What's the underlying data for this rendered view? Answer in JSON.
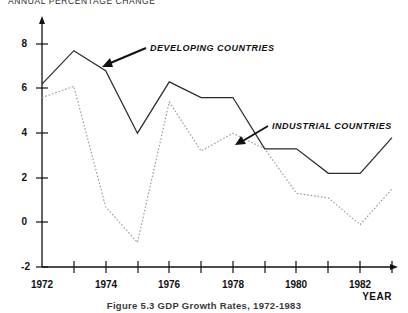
{
  "figure": {
    "top_title": "ANNUAL PERCENTAGE CHANGE",
    "caption": "Figure 5.3  GDP Growth Rates, 1972-1983",
    "xaxis_name": "YEAR"
  },
  "annotations": {
    "developing": "DEVELOPING COUNTRIES",
    "industrial": "INDUSTRIAL COUNTRIES"
  },
  "ticks": {
    "y": [
      "8",
      "6",
      "4",
      "2",
      "0",
      "-2"
    ],
    "x": [
      "1972",
      "1974",
      "1976",
      "1978",
      "1980",
      "1982"
    ]
  },
  "chart_data": {
    "type": "line",
    "title": "ANNUAL PERCENTAGE CHANGE",
    "subtitle": "Figure 5.3  GDP Growth Rates, 1972-1983",
    "xlabel": "YEAR",
    "ylabel": "ANNUAL PERCENTAGE CHANGE",
    "x": [
      1972,
      1973,
      1974,
      1975,
      1976,
      1977,
      1978,
      1979,
      1980,
      1981,
      1982,
      1983
    ],
    "xlim": [
      1972,
      1983
    ],
    "ylim": [
      -2,
      8
    ],
    "yticks": [
      -2,
      0,
      2,
      4,
      6,
      8
    ],
    "xticks": [
      1972,
      1974,
      1976,
      1978,
      1980,
      1982
    ],
    "xminor_ticks": [
      1973,
      1975,
      1977,
      1979,
      1981,
      1983
    ],
    "grid": false,
    "legend": "inline-annotations",
    "series": [
      {
        "name": "DEVELOPING COUNTRIES",
        "style": "solid",
        "color": "#2b2b2b",
        "values": [
          6.2,
          7.7,
          6.8,
          4.0,
          6.3,
          5.6,
          5.6,
          3.3,
          3.3,
          2.2,
          2.2,
          3.8
        ]
      },
      {
        "name": "INDUSTRIAL COUNTRIES",
        "style": "dotted",
        "color": "#9a9a9a",
        "values": [
          5.6,
          6.1,
          0.7,
          -0.9,
          5.4,
          3.2,
          4.0,
          3.3,
          1.3,
          1.1,
          -0.1,
          1.5
        ]
      }
    ]
  }
}
